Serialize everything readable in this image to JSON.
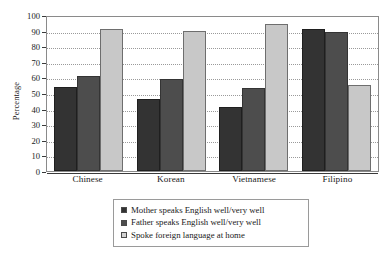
{
  "chart_data": {
    "type": "bar",
    "title": "",
    "xlabel": "",
    "ylabel": "Percentage",
    "ylim": [
      0,
      100
    ],
    "yticks": [
      0,
      10,
      20,
      30,
      40,
      50,
      60,
      70,
      80,
      90,
      100
    ],
    "ytick_labels": [
      "0",
      "10",
      "20",
      "30",
      "40",
      "50",
      "60",
      "70",
      "80",
      "90",
      "100"
    ],
    "grid": true,
    "legend_position": "bottom-center",
    "categories": [
      "Chinese",
      "Korean",
      "Vietnamese",
      "Filipino"
    ],
    "series": [
      {
        "name": "Mother speaks English well/very well",
        "color": "#333333",
        "values": [
          54,
          46,
          41,
          91
        ]
      },
      {
        "name": "Father speaks English well/very well",
        "color": "#4d4d4d",
        "values": [
          61,
          59,
          53,
          89
        ]
      },
      {
        "name": "Spoke foreign language at home",
        "color": "#c8c8c8",
        "values": [
          91,
          90,
          94,
          55
        ]
      }
    ]
  }
}
